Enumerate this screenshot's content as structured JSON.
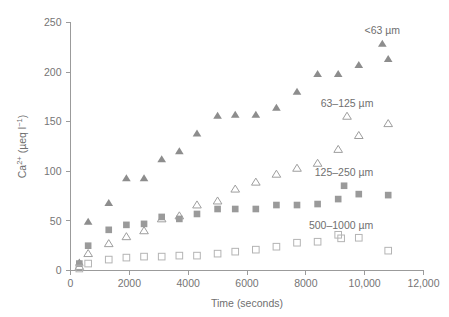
{
  "chart_data": {
    "type": "scatter",
    "title": "",
    "xlabel": "Time (seconds)",
    "ylabel": "Ca2+ (µeq l−1)",
    "ylabel_parts": {
      "base": "Ca",
      "superscript": "2+",
      "units_open": " (µeq l",
      "units_super": "−1",
      "units_close": ")"
    },
    "xlim": [
      0,
      12000
    ],
    "ylim": [
      0,
      250
    ],
    "xticks": [
      0,
      2000,
      4000,
      6000,
      8000,
      10000,
      12000
    ],
    "xtick_labels": [
      "0",
      "2000",
      "4000",
      "6000",
      "8000",
      "10,000",
      "12,000"
    ],
    "yticks": [
      0,
      50,
      100,
      150,
      200,
      250
    ],
    "ytick_labels": [
      "0",
      "50",
      "100",
      "150",
      "200",
      "250"
    ],
    "grid": false,
    "legend_position": "inline-right",
    "marker_color": "#8d8d8d",
    "axis_color": "#9b9b9b",
    "series": [
      {
        "name": "<63 µm",
        "marker": "filled-triangle",
        "color": "#8d8d8d",
        "label_x": 10600,
        "label_y": 238,
        "x": [
          300,
          600,
          1300,
          1900,
          2500,
          3100,
          3700,
          4300,
          5000,
          5600,
          6300,
          7000,
          7700,
          8400,
          9100,
          9800,
          10800
        ],
        "y": [
          8,
          49,
          68,
          93,
          93,
          112,
          120,
          138,
          156,
          157,
          157,
          164,
          180,
          198,
          198,
          207,
          213
        ]
      },
      {
        "name": "63–125 µm",
        "marker": "open-triangle",
        "color": "#9e9e9e",
        "label_x": 9400,
        "label_y": 165,
        "x": [
          300,
          600,
          1300,
          1900,
          2500,
          3100,
          3700,
          4300,
          5000,
          5600,
          6300,
          7000,
          7700,
          8400,
          9100,
          9800,
          10800
        ],
        "y": [
          4,
          17,
          27,
          34,
          40,
          52,
          55,
          66,
          70,
          82,
          89,
          97,
          103,
          108,
          122,
          136,
          148
        ]
      },
      {
        "name": "125–250 µm",
        "marker": "filled-square",
        "color": "#9a9a9a",
        "label_x": 9300,
        "label_y": 95,
        "x": [
          300,
          600,
          1300,
          1900,
          2500,
          3100,
          3700,
          4300,
          5000,
          5600,
          6300,
          7000,
          7700,
          8400,
          9100,
          9800,
          10800
        ],
        "y": [
          7,
          25,
          41,
          46,
          47,
          54,
          52,
          57,
          62,
          62,
          62,
          66,
          66,
          67,
          72,
          77,
          76
        ]
      },
      {
        "name": "500–1000 µm",
        "marker": "open-square",
        "color": "#b4b4b4",
        "label_x": 9200,
        "label_y": 42,
        "x": [
          300,
          600,
          1300,
          1900,
          2500,
          3100,
          3700,
          4300,
          5000,
          5600,
          6300,
          7000,
          7700,
          8400,
          9100,
          9800,
          10800
        ],
        "y": [
          2,
          7,
          11,
          13,
          14,
          14,
          15,
          15,
          17,
          19,
          21,
          24,
          28,
          29,
          36,
          33,
          20
        ]
      }
    ]
  }
}
